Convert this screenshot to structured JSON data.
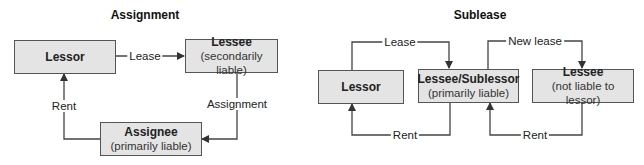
{
  "assignment": {
    "title": "Assignment",
    "nodes": {
      "lessor": {
        "label": "Lessor",
        "sub": ""
      },
      "lessee": {
        "label": "Lessee",
        "sub": "(secondarily liable)"
      },
      "assignee": {
        "label": "Assignee",
        "sub": "(primarily liable)"
      }
    },
    "edges": {
      "lease": "Lease",
      "assignment": "Assignment",
      "rent": "Rent"
    }
  },
  "sublease": {
    "title": "Sublease",
    "nodes": {
      "lessor": {
        "label": "Lessor",
        "sub": ""
      },
      "sublessor": {
        "label": "Lessee/Sublessor",
        "sub": "(primarily liable)"
      },
      "lessee": {
        "label": "Lessee",
        "sub": "(not liable to lessor)"
      }
    },
    "edges": {
      "lease": "Lease",
      "new_lease": "New lease",
      "rent_to_lessor": "Rent",
      "rent_to_sublessor": "Rent"
    }
  },
  "colors": {
    "box_fill": "#e4e4e4",
    "box_border": "#555555",
    "line": "#444444"
  }
}
